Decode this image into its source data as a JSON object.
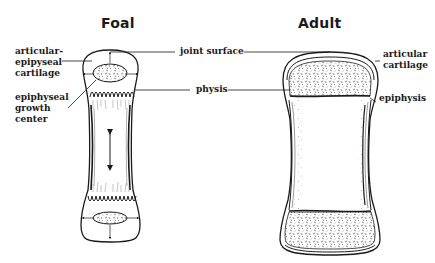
{
  "panels": {
    "foal": {
      "title": "Foal"
    },
    "adult": {
      "title": "Adult"
    }
  },
  "labels": {
    "articular_epipyseal_cartilage": [
      "articular-",
      "epipyseal",
      "cartilage"
    ],
    "epiphyseal_growth_center": [
      "epiphyseal",
      "growth",
      "center"
    ],
    "joint_surface": "joint surface",
    "physis": "physis",
    "articular_cartilage": [
      "articular",
      "cartilage"
    ],
    "epiphysis": "epiphysis"
  },
  "colors": {
    "ink": "#1a1a1a",
    "background": "#ffffff",
    "stipple": "#555555"
  }
}
